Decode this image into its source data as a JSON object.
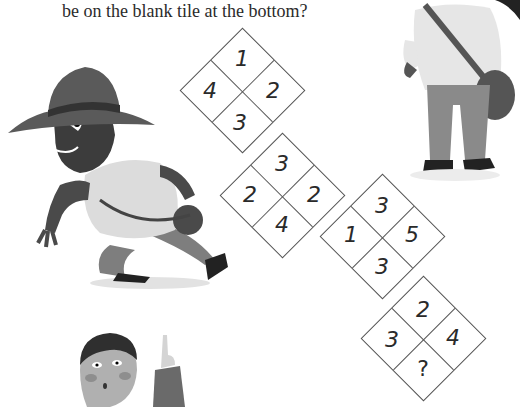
{
  "question": {
    "line1": "What number should",
    "line2": "be on the blank tile at the bottom?"
  },
  "tiles": [
    {
      "top": "1",
      "left": "4",
      "right": "2",
      "bottom": "3",
      "cx": 242,
      "cy": 90
    },
    {
      "top": "3",
      "left": "2",
      "right": "2",
      "bottom": "4",
      "cx": 282,
      "cy": 195
    },
    {
      "top": "3",
      "left": "1",
      "right": "5",
      "bottom": "3",
      "cx": 382,
      "cy": 236
    },
    {
      "top": "2",
      "left": "3",
      "right": "4",
      "bottom": "?",
      "cx": 423,
      "cy": 338
    }
  ],
  "illustrations": [
    "explorer-running",
    "standing-explorer",
    "man-pointing-up"
  ]
}
